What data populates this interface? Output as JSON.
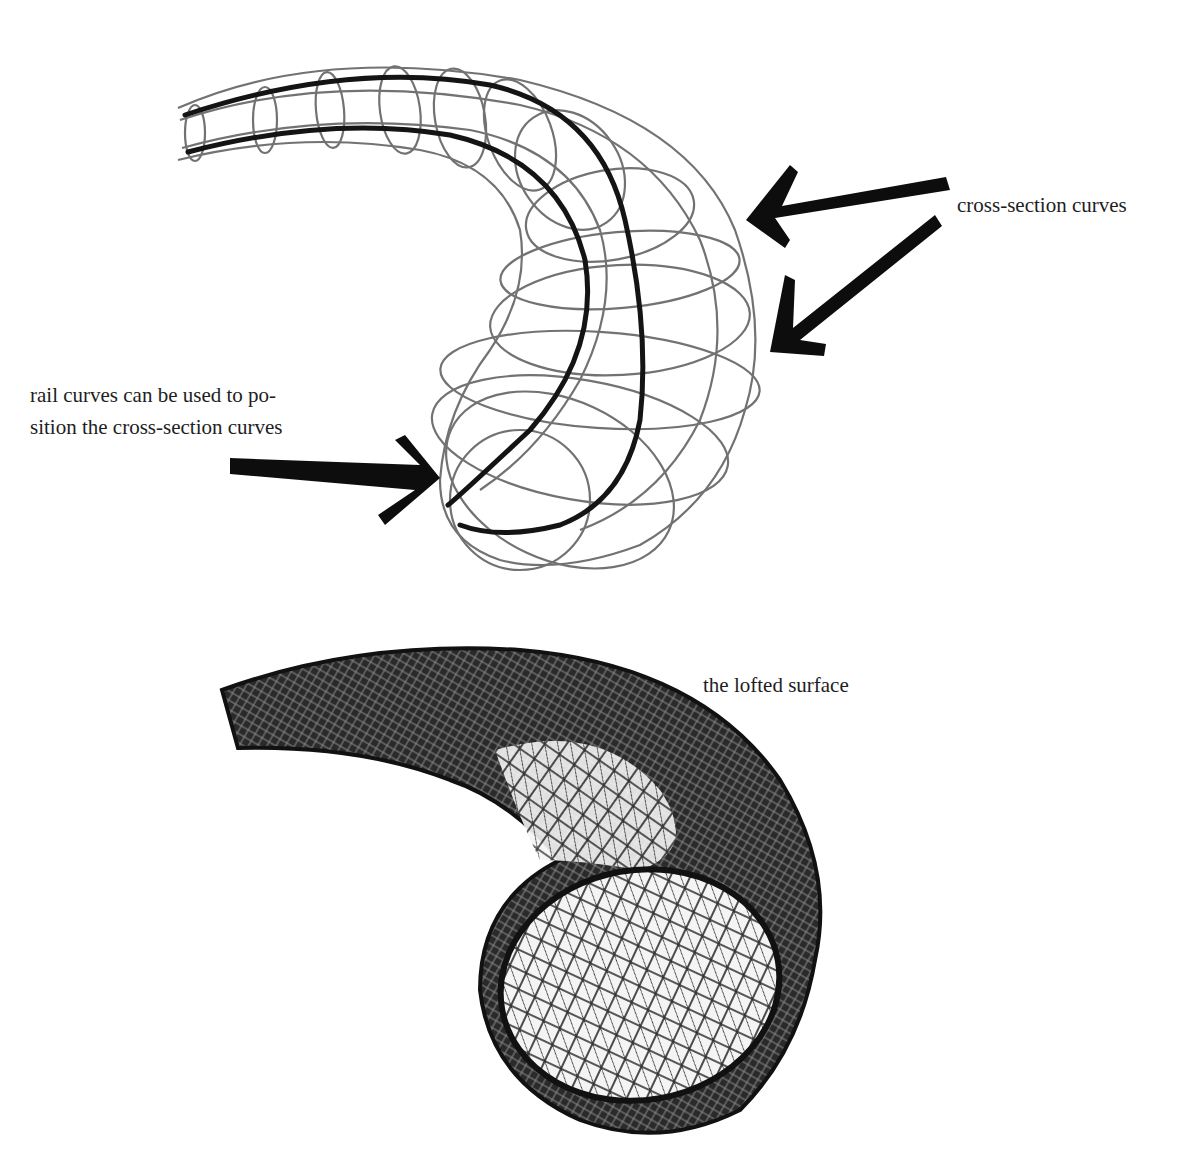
{
  "labels": {
    "cross_section": "cross-section curves",
    "rail_line1": "rail curves can be used to po-",
    "rail_line2": "sition the cross-section curves",
    "lofted": "the lofted surface"
  },
  "colors": {
    "ink": "#111111",
    "wire": "#555555",
    "background": "#ffffff"
  }
}
